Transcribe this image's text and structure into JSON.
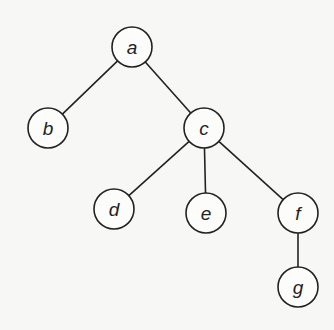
{
  "diagram": {
    "type": "tree",
    "nodes": [
      {
        "id": "a",
        "label": "a",
        "x": 132,
        "y": 47
      },
      {
        "id": "b",
        "label": "b",
        "x": 48,
        "y": 128
      },
      {
        "id": "c",
        "label": "c",
        "x": 204,
        "y": 128
      },
      {
        "id": "d",
        "label": "d",
        "x": 114,
        "y": 209
      },
      {
        "id": "e",
        "label": "e",
        "x": 206,
        "y": 213
      },
      {
        "id": "f",
        "label": "f",
        "x": 298,
        "y": 213
      },
      {
        "id": "g",
        "label": "g",
        "x": 298,
        "y": 287
      }
    ],
    "edges": [
      [
        "a",
        "b"
      ],
      [
        "a",
        "c"
      ],
      [
        "c",
        "d"
      ],
      [
        "c",
        "e"
      ],
      [
        "c",
        "f"
      ],
      [
        "f",
        "g"
      ]
    ],
    "node_radius": 20
  }
}
